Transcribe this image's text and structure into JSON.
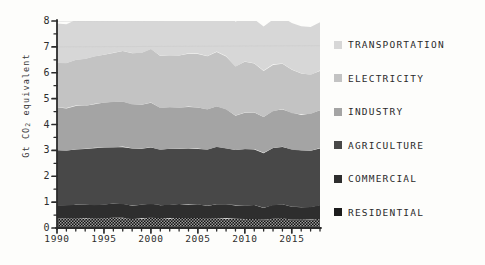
{
  "chart_data": {
    "type": "area",
    "stacked": true,
    "title": "",
    "xlabel": "",
    "ylabel": "Gt CO2 equivalent",
    "ylabel_prefix": "Gt CO",
    "ylabel_sub": "2",
    "ylabel_suffix": " equivalent",
    "xlim": [
      1990,
      2018
    ],
    "ylim": [
      0,
      8
    ],
    "y_ticks": [
      0,
      1,
      2,
      3,
      4,
      5,
      6,
      7,
      8
    ],
    "y_tick_labels": [
      "0",
      "1",
      "2",
      "3",
      "4",
      "5",
      "6",
      "7",
      "8"
    ],
    "y_minor_ticks": [
      0.5,
      1.5,
      2.5,
      3.5,
      4.5,
      5.5,
      6.5,
      7.5
    ],
    "x_ticks": [
      1990,
      1995,
      2000,
      2005,
      2010,
      2015
    ],
    "x_tick_labels": [
      "1990",
      "1995",
      "2000",
      "2005",
      "2010",
      "2015"
    ],
    "grid": "horizontal-faint",
    "gridlines": [
      7,
      8
    ],
    "legend_position": "right",
    "x": [
      1990,
      1991,
      1992,
      1993,
      1994,
      1995,
      1996,
      1997,
      1998,
      1999,
      2000,
      2001,
      2002,
      2003,
      2004,
      2005,
      2006,
      2007,
      2008,
      2009,
      2010,
      2011,
      2012,
      2013,
      2014,
      2015,
      2016,
      2017,
      2018
    ],
    "series": [
      {
        "name": "Residential",
        "color": "#1c1c1c",
        "pattern": "dotted",
        "values": [
          0.35,
          0.37,
          0.38,
          0.39,
          0.38,
          0.38,
          0.4,
          0.39,
          0.36,
          0.37,
          0.39,
          0.37,
          0.38,
          0.39,
          0.38,
          0.38,
          0.35,
          0.38,
          0.38,
          0.36,
          0.35,
          0.36,
          0.31,
          0.36,
          0.37,
          0.33,
          0.32,
          0.32,
          0.35
        ]
      },
      {
        "name": "Commercial",
        "color": "#2e2e2e",
        "values": [
          0.5,
          0.5,
          0.51,
          0.51,
          0.51,
          0.52,
          0.54,
          0.53,
          0.51,
          0.52,
          0.54,
          0.52,
          0.52,
          0.54,
          0.53,
          0.53,
          0.5,
          0.53,
          0.54,
          0.52,
          0.51,
          0.52,
          0.47,
          0.52,
          0.54,
          0.5,
          0.49,
          0.49,
          0.53
        ]
      },
      {
        "name": "Agriculture",
        "color": "#484848",
        "values": [
          2.15,
          2.12,
          2.16,
          2.15,
          2.21,
          2.22,
          2.18,
          2.22,
          2.2,
          2.18,
          2.2,
          2.14,
          2.16,
          2.14,
          2.18,
          2.16,
          2.17,
          2.22,
          2.16,
          2.12,
          2.18,
          2.16,
          2.12,
          2.2,
          2.22,
          2.2,
          2.18,
          2.18,
          2.2
        ]
      },
      {
        "name": "Industry",
        "color": "#a4a4a4",
        "values": [
          1.66,
          1.64,
          1.68,
          1.66,
          1.7,
          1.72,
          1.74,
          1.74,
          1.7,
          1.7,
          1.72,
          1.62,
          1.6,
          1.58,
          1.6,
          1.58,
          1.56,
          1.56,
          1.5,
          1.34,
          1.42,
          1.42,
          1.4,
          1.44,
          1.46,
          1.42,
          1.4,
          1.42,
          1.46
        ]
      },
      {
        "name": "Electricity",
        "color": "#c3c3c3",
        "values": [
          1.72,
          1.74,
          1.76,
          1.82,
          1.84,
          1.86,
          1.92,
          1.96,
          2.0,
          2.0,
          2.06,
          2.0,
          2.02,
          2.02,
          2.06,
          2.1,
          2.06,
          2.12,
          2.06,
          1.9,
          1.98,
          1.9,
          1.78,
          1.8,
          1.78,
          1.68,
          1.58,
          1.5,
          1.54
        ]
      },
      {
        "name": "Transportation",
        "color": "#d7d7d7",
        "values": [
          1.52,
          1.5,
          1.55,
          1.58,
          1.62,
          1.64,
          1.68,
          1.7,
          1.74,
          1.78,
          1.82,
          1.8,
          1.84,
          1.84,
          1.88,
          1.9,
          1.9,
          1.9,
          1.82,
          1.74,
          1.74,
          1.72,
          1.7,
          1.72,
          1.76,
          1.8,
          1.84,
          1.86,
          1.88
        ]
      }
    ]
  },
  "legend": {
    "items": [
      {
        "label": "Transportation",
        "color": "#d7d7d7"
      },
      {
        "label": "Electricity",
        "color": "#c3c3c3"
      },
      {
        "label": "Industry",
        "color": "#a4a4a4"
      },
      {
        "label": "Agriculture",
        "color": "#484848"
      },
      {
        "label": "Commercial",
        "color": "#2e2e2e"
      },
      {
        "label": "Residential",
        "color": "#1c1c1c"
      }
    ]
  }
}
